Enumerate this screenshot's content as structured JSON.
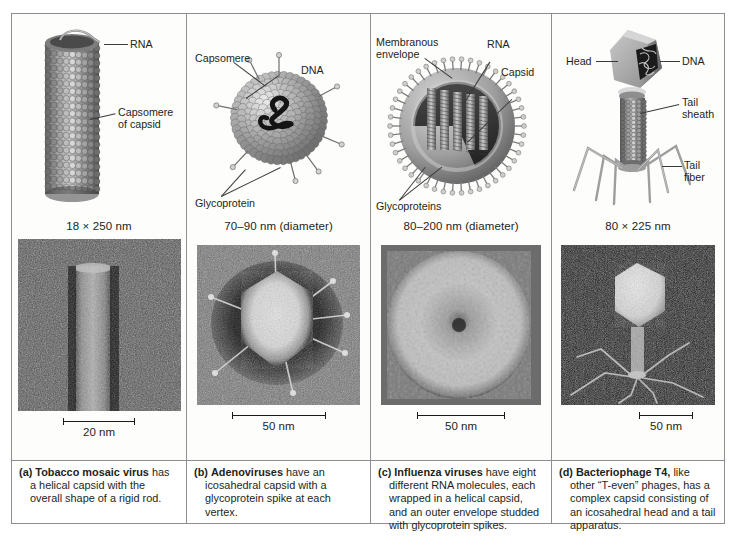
{
  "figure": {
    "panels": [
      {
        "key": "a",
        "dimension": "18 × 250 nm",
        "labels": [
          "RNA",
          "Capsomere\nof capsid"
        ],
        "scale_bar": "20 nm",
        "caption_marker": "(a)",
        "caption_bold": "Tobacco mosaic virus",
        "caption_rest": " has a helical capsid with the overall shape of a rigid rod.",
        "micrograph_alt": "tobacco-mosaic-virus-micrograph"
      },
      {
        "key": "b",
        "dimension": "70–90 nm (diameter)",
        "labels": [
          "Capsomere",
          "DNA",
          "Glycoprotein"
        ],
        "scale_bar": "50 nm",
        "caption_marker": "(b)",
        "caption_bold": "Adenoviruses",
        "caption_rest": " have an icosahedral capsid with a glycoprotein spike at each vertex.",
        "micrograph_alt": "adenovirus-micrograph"
      },
      {
        "key": "c",
        "dimension": "80–200 nm (diameter)",
        "labels": [
          "Membranous\nenvelope",
          "RNA",
          "Capsid",
          "Glycoproteins"
        ],
        "scale_bar": "50 nm",
        "caption_marker": "(c)",
        "caption_bold": "Influenza viruses",
        "caption_rest": " have eight different RNA molecules, each wrapped in a helical capsid, and an outer envelope studded with glycoprotein spikes.",
        "micrograph_alt": "influenza-virus-micrograph"
      },
      {
        "key": "d",
        "dimension": "80 × 225 nm",
        "labels": [
          "Head",
          "DNA",
          "Tail\nsheath",
          "Tail\nfiber"
        ],
        "scale_bar": "50 nm",
        "caption_marker": "(d)",
        "caption_bold": "Bacteriophage T4,",
        "caption_rest": " like other “T-even” phages, has a complex capsid consisting of an icosahedral head and a tail apparatus.",
        "micrograph_alt": "bacteriophage-t4-micrograph"
      }
    ]
  },
  "colors": {
    "frame": "#8e8e8e",
    "text": "#231f20",
    "leader": "#3a3a3a",
    "capsid_light": "#cfcfcf",
    "capsid_mid": "#9a9a9a",
    "capsid_dark": "#5f5f5f"
  }
}
